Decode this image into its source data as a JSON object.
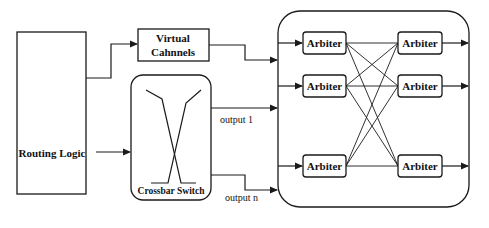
{
  "diagram": {
    "routing_logic": {
      "label": "Routing Logic"
    },
    "virtual_channels": {
      "line1": "Virtual",
      "line2": "Cahnnels"
    },
    "crossbar_switch": {
      "label": "Crossbar Switch"
    },
    "outputs": {
      "first": "output 1",
      "last": "output n"
    },
    "arbiters": {
      "left": [
        "Arbiter",
        "Arbiter",
        "Arbiter"
      ],
      "right": [
        "Arbiter",
        "Arbiter",
        "Arbiter"
      ]
    },
    "colors": {
      "stroke": "#1a1a1a",
      "background": "#ffffff",
      "text": "#111111"
    }
  }
}
